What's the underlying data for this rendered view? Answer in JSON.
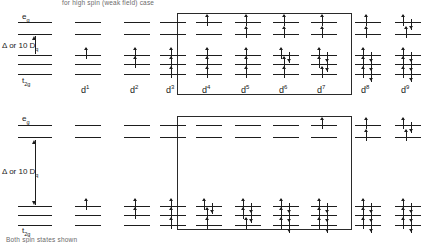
{
  "figure": {
    "caption_top": "for high spin (weak field) case",
    "caption_bottom": "Both spin states shown",
    "axis": {
      "eg_label": "e",
      "eg_sub": "g",
      "t2g_label": "t",
      "t2g_sub": "2g",
      "delta_label": "Δ or 10 D",
      "delta_sub": "q"
    },
    "box_label": "high-spin / low-spin differ"
  },
  "columns": [
    {
      "label": "d",
      "sup": "1"
    },
    {
      "label": "d",
      "sup": "2"
    },
    {
      "label": "d",
      "sup": "3"
    },
    {
      "label": "d",
      "sup": "4"
    },
    {
      "label": "d",
      "sup": "5"
    },
    {
      "label": "d",
      "sup": "6"
    },
    {
      "label": "d",
      "sup": "7"
    },
    {
      "label": "d",
      "sup": "8"
    },
    {
      "label": "d",
      "sup": "9"
    }
  ],
  "rows": [
    {
      "name": "high-spin",
      "splitting": "small",
      "configs": [
        {
          "d": 1,
          "eg": [
            0,
            0
          ],
          "t2g": [
            1,
            0,
            0
          ]
        },
        {
          "d": 2,
          "eg": [
            0,
            0
          ],
          "t2g": [
            1,
            1,
            0
          ]
        },
        {
          "d": 3,
          "eg": [
            0,
            0
          ],
          "t2g": [
            1,
            1,
            1
          ]
        },
        {
          "d": 4,
          "eg": [
            1,
            0
          ],
          "t2g": [
            1,
            1,
            1
          ]
        },
        {
          "d": 5,
          "eg": [
            1,
            1
          ],
          "t2g": [
            1,
            1,
            1
          ]
        },
        {
          "d": 6,
          "eg": [
            1,
            1
          ],
          "t2g": [
            2,
            1,
            1
          ]
        },
        {
          "d": 7,
          "eg": [
            1,
            1
          ],
          "t2g": [
            2,
            2,
            1
          ]
        },
        {
          "d": 8,
          "eg": [
            1,
            1
          ],
          "t2g": [
            2,
            2,
            2
          ]
        },
        {
          "d": 9,
          "eg": [
            2,
            1
          ],
          "t2g": [
            2,
            2,
            2
          ]
        }
      ]
    },
    {
      "name": "low-spin",
      "splitting": "large",
      "configs": [
        {
          "d": 1,
          "eg": [
            0,
            0
          ],
          "t2g": [
            1,
            0,
            0
          ]
        },
        {
          "d": 2,
          "eg": [
            0,
            0
          ],
          "t2g": [
            1,
            1,
            0
          ]
        },
        {
          "d": 3,
          "eg": [
            0,
            0
          ],
          "t2g": [
            1,
            1,
            1
          ]
        },
        {
          "d": 4,
          "eg": [
            0,
            0
          ],
          "t2g": [
            2,
            1,
            1
          ]
        },
        {
          "d": 5,
          "eg": [
            0,
            0
          ],
          "t2g": [
            2,
            2,
            1
          ]
        },
        {
          "d": 6,
          "eg": [
            0,
            0
          ],
          "t2g": [
            2,
            2,
            2
          ]
        },
        {
          "d": 7,
          "eg": [
            1,
            0
          ],
          "t2g": [
            2,
            2,
            2
          ]
        },
        {
          "d": 8,
          "eg": [
            1,
            1
          ],
          "t2g": [
            2,
            2,
            2
          ]
        },
        {
          "d": 9,
          "eg": [
            2,
            1
          ],
          "t2g": [
            2,
            2,
            2
          ]
        }
      ]
    }
  ],
  "geometry": {
    "column_x": [
      75,
      124,
      160,
      196,
      235,
      273,
      311,
      355,
      395
    ],
    "level_width": 26,
    "row_top": {
      "eg_y": [
        22,
        34
      ],
      "t2g_y": [
        55,
        64,
        74
      ],
      "label_y": 92
    },
    "row_bottom": {
      "eg_y": [
        125,
        137
      ],
      "t2g_y": [
        206,
        215,
        225
      ],
      "label_y": 238
    },
    "box": {
      "x": 177,
      "y": 13,
      "w": 175,
      "h": 82
    },
    "box_bottom": {
      "x": 177,
      "y": 116,
      "w": 175,
      "h": 114
    }
  }
}
